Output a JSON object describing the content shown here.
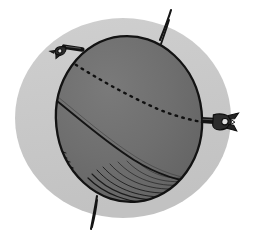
{
  "figure": {
    "title": "Sphere with clamps and great-circle arcs",
    "canvas": {
      "width": 254,
      "height": 239
    },
    "colors": {
      "page_background": "#ffffff",
      "halo": "#c8c8c8",
      "sphere_fill": "#6e6e6e",
      "sphere_fill_shadow": "#5f5f5f",
      "ink": "#111111",
      "clamp_fill": "#3a3a3a",
      "clamp_highlight": "#d8d8d8"
    },
    "geometry": {
      "halo": {
        "cx": 123,
        "cy": 118,
        "rx": 108,
        "ry": 100
      },
      "sphere": {
        "cx": 129,
        "cy": 119,
        "rx": 73,
        "ry": 83,
        "rotation_deg": -6
      },
      "axis_top": {
        "x1": 160,
        "y1": 38,
        "x2": 172,
        "y2": 11
      },
      "axis_bottom": {
        "x1": 96,
        "y1": 197,
        "x2": 91,
        "y2": 228
      },
      "clamp_left": {
        "x": 56,
        "y": 46,
        "angle_deg": -35
      },
      "clamp_right": {
        "x": 206,
        "y": 120,
        "angle_deg": 0
      }
    },
    "elements": {
      "halo_label": "background halo ellipse",
      "sphere_label": "shaded sphere body",
      "equator_dotted_label": "dotted great-circle arc (far side)",
      "equator_solid_label": "solid great-circle arc (near side)",
      "meridian_label": "solid meridian curve",
      "hatching_label": "bottom-left hatch shading",
      "axis_label": "axis pin line",
      "clamp_left_label": "upper-left clamp",
      "clamp_right_label": "right clamp"
    },
    "counts": {
      "clamps": 2,
      "axis_lines": 2,
      "great_circle_arcs": 2,
      "hatch_strokes": 26
    }
  }
}
